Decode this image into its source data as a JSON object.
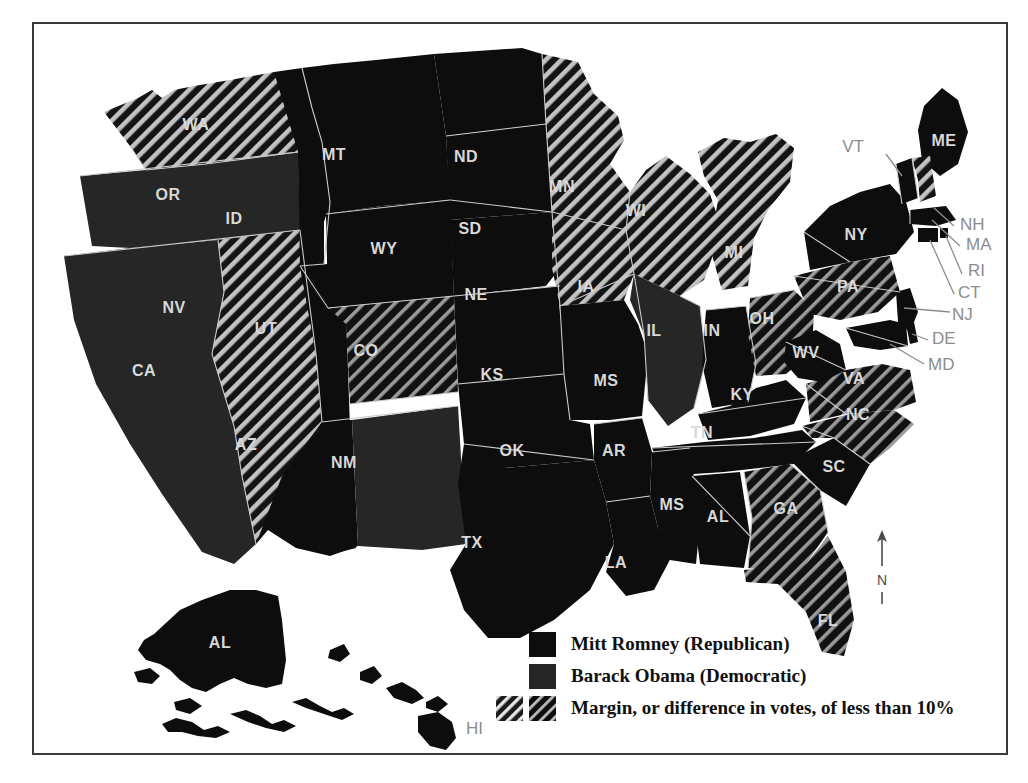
{
  "map": {
    "title_present": false,
    "north_arrow_label": "N",
    "colors": {
      "romney_fill": "#0d0d0d",
      "obama_fill": "#262626",
      "hatch_stroke": "#b9b9b9",
      "border_stroke": "#c9c9c9",
      "label_fill": "#d8d8d8",
      "outside_label_fill": "#8d8d8d",
      "page_background": "#ffffff",
      "frame_stroke": "#3a3a3a"
    },
    "states": [
      {
        "code": "WA",
        "party": "obama",
        "close_margin": true,
        "label_inside": true
      },
      {
        "code": "OR",
        "party": "obama",
        "close_margin": false,
        "label_inside": true
      },
      {
        "code": "CA",
        "party": "obama",
        "close_margin": false,
        "label_inside": true
      },
      {
        "code": "NV",
        "party": "obama",
        "close_margin": true,
        "label_inside": true
      },
      {
        "code": "ID",
        "party": "romney",
        "close_margin": false,
        "label_inside": true
      },
      {
        "code": "MT",
        "party": "romney",
        "close_margin": false,
        "label_inside": true
      },
      {
        "code": "WY",
        "party": "romney",
        "close_margin": false,
        "label_inside": true
      },
      {
        "code": "UT",
        "party": "romney",
        "close_margin": false,
        "label_inside": true
      },
      {
        "code": "AZ",
        "party": "romney",
        "close_margin": false,
        "label_inside": true
      },
      {
        "code": "CO",
        "party": "obama",
        "close_margin": true,
        "label_inside": true
      },
      {
        "code": "NM",
        "party": "obama",
        "close_margin": false,
        "label_inside": true
      },
      {
        "code": "ND",
        "party": "romney",
        "close_margin": false,
        "label_inside": true
      },
      {
        "code": "SD",
        "party": "romney",
        "close_margin": false,
        "label_inside": true
      },
      {
        "code": "NE",
        "party": "romney",
        "close_margin": false,
        "label_inside": true
      },
      {
        "code": "KS",
        "party": "romney",
        "close_margin": false,
        "label_inside": true
      },
      {
        "code": "OK",
        "party": "romney",
        "close_margin": false,
        "label_inside": true
      },
      {
        "code": "TX",
        "party": "romney",
        "close_margin": false,
        "label_inside": true
      },
      {
        "code": "MN",
        "party": "obama",
        "close_margin": true,
        "label_inside": true
      },
      {
        "code": "IA",
        "party": "obama",
        "close_margin": true,
        "label_inside": true
      },
      {
        "code": "MS",
        "party": "romney",
        "close_margin": false,
        "label_inside": true
      },
      {
        "code": "AR",
        "party": "romney",
        "close_margin": false,
        "label_inside": true
      },
      {
        "code": "LA",
        "party": "romney",
        "close_margin": false,
        "label_inside": true
      },
      {
        "code": "WI",
        "party": "obama",
        "close_margin": true,
        "label_inside": true
      },
      {
        "code": "IL",
        "party": "obama",
        "close_margin": false,
        "label_inside": true
      },
      {
        "code": "MI",
        "party": "obama",
        "close_margin": true,
        "label_inside": true
      },
      {
        "code": "IN",
        "party": "romney",
        "close_margin": false,
        "label_inside": true
      },
      {
        "code": "OH",
        "party": "obama",
        "close_margin": true,
        "label_inside": true
      },
      {
        "code": "KY",
        "party": "romney",
        "close_margin": false,
        "label_inside": true
      },
      {
        "code": "TN",
        "party": "romney",
        "close_margin": false,
        "label_inside": true
      },
      {
        "code": "AL",
        "party": "romney",
        "close_margin": false,
        "label_inside": true
      },
      {
        "code": "GA",
        "party": "romney",
        "close_margin": true,
        "label_inside": true
      },
      {
        "code": "FL",
        "party": "obama",
        "close_margin": true,
        "label_inside": true
      },
      {
        "code": "SC",
        "party": "romney",
        "close_margin": false,
        "label_inside": true
      },
      {
        "code": "NC",
        "party": "romney",
        "close_margin": true,
        "label_inside": true
      },
      {
        "code": "VA",
        "party": "obama",
        "close_margin": true,
        "label_inside": true
      },
      {
        "code": "WV",
        "party": "romney",
        "close_margin": false,
        "label_inside": true
      },
      {
        "code": "PA",
        "party": "obama",
        "close_margin": true,
        "label_inside": true
      },
      {
        "code": "NY",
        "party": "obama",
        "close_margin": false,
        "label_inside": true
      },
      {
        "code": "ME",
        "party": "obama",
        "close_margin": false,
        "label_inside": true
      },
      {
        "code": "VT",
        "party": "obama",
        "close_margin": false,
        "label_inside": false
      },
      {
        "code": "NH",
        "party": "obama",
        "close_margin": true,
        "label_inside": false
      },
      {
        "code": "MA",
        "party": "obama",
        "close_margin": false,
        "label_inside": false
      },
      {
        "code": "RI",
        "party": "obama",
        "close_margin": false,
        "label_inside": false
      },
      {
        "code": "CT",
        "party": "obama",
        "close_margin": false,
        "label_inside": false
      },
      {
        "code": "NJ",
        "party": "obama",
        "close_margin": false,
        "label_inside": false
      },
      {
        "code": "DE",
        "party": "obama",
        "close_margin": false,
        "label_inside": false
      },
      {
        "code": "MD",
        "party": "obama",
        "close_margin": false,
        "label_inside": false
      },
      {
        "code": "AL",
        "party": "romney",
        "close_margin": false,
        "label_inside": true,
        "inset": "alaska"
      },
      {
        "code": "HI",
        "party": "obama",
        "close_margin": false,
        "label_inside": false,
        "inset": "hawaii"
      }
    ]
  },
  "legend": {
    "rows": [
      {
        "id": "romney",
        "label": "Mitt Romney (Republican)",
        "swatches": [
          "solid-dark"
        ]
      },
      {
        "id": "obama",
        "label": "Barack Obama (Democratic)",
        "swatches": [
          "solid-mid"
        ]
      },
      {
        "id": "margin",
        "label": "Margin, or difference in votes, of less than 10%",
        "swatches": [
          "hatch-light",
          "hatch-dark"
        ]
      }
    ]
  }
}
